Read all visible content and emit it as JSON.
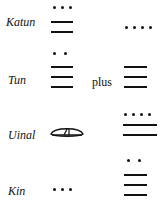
{
  "figure": {
    "rows": [
      {
        "label": "Katun",
        "left_value": 13,
        "right_value": 4
      },
      {
        "label": "Tun",
        "connector": "plus",
        "left_value": 17,
        "right_value": 15
      },
      {
        "label": "Uinal",
        "left_value": 0,
        "right_value": 14
      },
      {
        "label": "Kin",
        "left_value": 3,
        "right_value": 17
      }
    ],
    "glyphs": {
      "dot": "dot = 1",
      "bar": "bar = 5",
      "shell": "shell = 0"
    },
    "ink_color": "#111111"
  }
}
